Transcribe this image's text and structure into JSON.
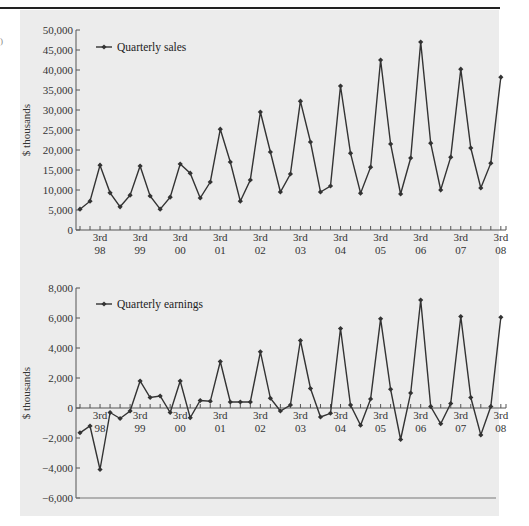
{
  "chart_data": [
    {
      "type": "line",
      "title": "",
      "legend": [
        "Quarterly sales"
      ],
      "legend_position": "top-left inside",
      "ylabel": "$ thousands",
      "xlabel": "",
      "ylim": [
        0,
        50000
      ],
      "yticks": [
        0,
        5000,
        10000,
        15000,
        20000,
        25000,
        30000,
        35000,
        40000,
        45000,
        50000
      ],
      "ytick_labels": [
        "0",
        "5,000",
        "10,000",
        "15,000",
        "20,000",
        "25,000",
        "30,000",
        "35,000",
        "40,000",
        "45,000",
        "50,000"
      ],
      "xtick_labels": [
        {
          "line1": "3rd",
          "line2": "98"
        },
        {
          "line1": "3rd",
          "line2": "99"
        },
        {
          "line1": "3rd",
          "line2": "00"
        },
        {
          "line1": "3rd",
          "line2": "01"
        },
        {
          "line1": "3rd",
          "line2": "02"
        },
        {
          "line1": "3rd",
          "line2": "03"
        },
        {
          "line1": "3rd",
          "line2": "04"
        },
        {
          "line1": "3rd",
          "line2": "05"
        },
        {
          "line1": "3rd",
          "line2": "06"
        },
        {
          "line1": "3rd",
          "line2": "07"
        },
        {
          "line1": "3rd",
          "line2": "08"
        }
      ],
      "x": [
        "Q1 98",
        "Q2 98",
        "Q3 98",
        "Q4 98",
        "Q1 99",
        "Q2 99",
        "Q3 99",
        "Q4 99",
        "Q1 00",
        "Q2 00",
        "Q3 00",
        "Q4 00",
        "Q1 01",
        "Q2 01",
        "Q3 01",
        "Q4 01",
        "Q1 02",
        "Q2 02",
        "Q3 02",
        "Q4 02",
        "Q1 03",
        "Q2 03",
        "Q3 03",
        "Q4 03",
        "Q1 04",
        "Q2 04",
        "Q3 04",
        "Q4 04",
        "Q1 05",
        "Q2 05",
        "Q3 05",
        "Q4 05",
        "Q1 06",
        "Q2 06",
        "Q3 06",
        "Q4 06",
        "Q1 07",
        "Q2 07",
        "Q3 07",
        "Q4 07",
        "Q1 08",
        "Q2 08",
        "Q3 08"
      ],
      "series": [
        {
          "name": "Quarterly sales",
          "values": [
            5200,
            7200,
            16200,
            9300,
            5800,
            8700,
            16000,
            8500,
            5200,
            8200,
            16500,
            14200,
            8000,
            12000,
            25200,
            17000,
            7200,
            12500,
            29500,
            19500,
            9500,
            14000,
            32200,
            22000,
            9500,
            11000,
            36000,
            19200,
            9200,
            15700,
            42500,
            21500,
            9000,
            18000,
            47000,
            21700,
            10000,
            18200,
            40200,
            20500,
            10500,
            16700,
            38200
          ]
        }
      ],
      "grid": false
    },
    {
      "type": "line",
      "title": "",
      "legend": [
        "Quarterly earnings"
      ],
      "legend_position": "top-left inside",
      "ylabel": "$ thousands",
      "xlabel": "",
      "ylim": [
        -6000,
        8000
      ],
      "yticks": [
        -6000,
        -4000,
        -2000,
        0,
        2000,
        4000,
        6000,
        8000
      ],
      "ytick_labels": [
        "−6,000",
        "−4,000",
        "−2,000",
        "0",
        "2,000",
        "4,000",
        "6,000",
        "8,000"
      ],
      "xtick_labels": [
        {
          "line1": "3rd",
          "line2": "98"
        },
        {
          "line1": "3rd",
          "line2": "99"
        },
        {
          "line1": "3rd",
          "line2": "00"
        },
        {
          "line1": "3rd",
          "line2": "01"
        },
        {
          "line1": "3rd",
          "line2": "02"
        },
        {
          "line1": "3rd",
          "line2": "03"
        },
        {
          "line1": "3rd",
          "line2": "04"
        },
        {
          "line1": "3rd",
          "line2": "05"
        },
        {
          "line1": "3rd",
          "line2": "06"
        },
        {
          "line1": "3rd",
          "line2": "07"
        },
        {
          "line1": "3rd",
          "line2": "08"
        }
      ],
      "x": [
        "Q1 98",
        "Q2 98",
        "Q3 98",
        "Q4 98",
        "Q1 99",
        "Q2 99",
        "Q3 99",
        "Q4 99",
        "Q1 00",
        "Q2 00",
        "Q3 00",
        "Q4 00",
        "Q1 01",
        "Q2 01",
        "Q3 01",
        "Q4 01",
        "Q1 02",
        "Q2 02",
        "Q3 02",
        "Q4 02",
        "Q1 03",
        "Q2 03",
        "Q3 03",
        "Q4 03",
        "Q1 04",
        "Q2 04",
        "Q3 04",
        "Q4 04",
        "Q1 05",
        "Q2 05",
        "Q3 05",
        "Q4 05",
        "Q1 06",
        "Q2 06",
        "Q3 06",
        "Q4 06",
        "Q1 07",
        "Q2 07",
        "Q3 07",
        "Q4 07",
        "Q1 08",
        "Q2 08",
        "Q3 08"
      ],
      "series": [
        {
          "name": "Quarterly earnings",
          "values": [
            -1650,
            -1200,
            -4100,
            -300,
            -700,
            -200,
            1800,
            700,
            800,
            -300,
            1800,
            -650,
            500,
            450,
            3100,
            400,
            400,
            400,
            3750,
            650,
            -200,
            200,
            4500,
            1300,
            -600,
            -350,
            5300,
            200,
            -1150,
            600,
            5950,
            1250,
            -2100,
            1000,
            7200,
            100,
            -1050,
            300,
            6100,
            700,
            -1800,
            100,
            6050
          ]
        }
      ],
      "grid": false
    }
  ],
  "colors": {
    "background": "#ececec",
    "line": "#333333",
    "axis": "#555555",
    "rule": "#222222"
  }
}
